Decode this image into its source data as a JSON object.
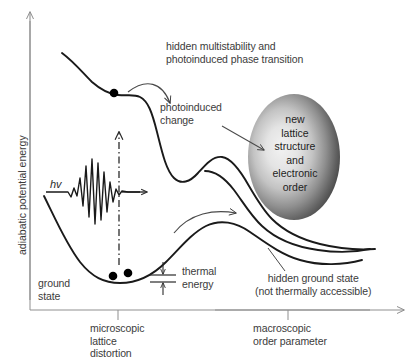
{
  "figure": {
    "axes": {
      "y_label": "adiabatic potential energy",
      "x_label_left": "microscopic\nlattice\ndistortion",
      "x_label_right": "macroscopic\norder parameter"
    },
    "annotations": {
      "top_note": "hidden multistability and\nphotoinduced phase transition",
      "photoinduced_change": "photoinduced\nchange",
      "ellipse_text": "new\nlattice\nstructure\nand\nelectronic\norder",
      "ground_state": "ground\nstate",
      "thermal_energy": "thermal\nenergy",
      "hidden_ground_state": "hidden ground state\n(not thermally accessible)",
      "photon_label": "hv"
    },
    "colors": {
      "curve": "#1a1a1a",
      "text": "#3b3b3b",
      "axis": "#8a8a8a",
      "frame": "#7a7a7a",
      "dot": "#000000",
      "ellipse_dark": "#4a4a4a",
      "ellipse_light": "#ededed",
      "background": "#ffffff"
    },
    "markers": {
      "excited_state_dot": {
        "x": 114,
        "y": 93,
        "r": 4.2
      },
      "ground_state_dot_1": {
        "x": 113,
        "y": 276,
        "r": 4.2
      },
      "ground_state_dot_2": {
        "x": 128,
        "y": 273,
        "r": 4.2
      }
    }
  }
}
